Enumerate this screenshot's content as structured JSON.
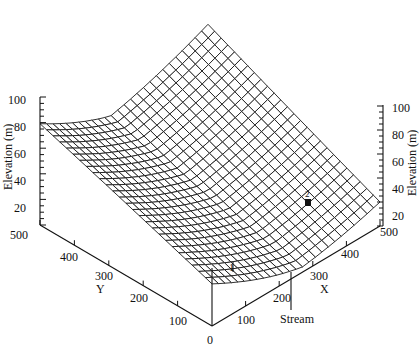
{
  "chart_data": {
    "type": "surface3d",
    "title": "",
    "zlabel": "Elevation (m)",
    "xlabel": "X",
    "ylabel": "Y",
    "x_ticks": [
      0,
      100,
      200,
      300,
      400,
      500
    ],
    "y_ticks": [
      0,
      100,
      200,
      300,
      400,
      500
    ],
    "z_ticks": [
      20,
      40,
      60,
      80,
      100
    ],
    "xlim": [
      0,
      500
    ],
    "ylim": [
      0,
      500
    ],
    "zlim": [
      0,
      100
    ],
    "grid": "wireframe mesh, approx 25 x 25 cells",
    "surface_description": "Valley surface: elevation ~100 m along high corner (Y=500, X=0) and far edge, descending to a stream channel near X~250-300 at Y=0; low point ~0-5 m near origin side",
    "annotations": [
      {
        "label": "1",
        "description": "marker near valley bottom close to Y~50, X~150"
      },
      {
        "label": "2",
        "description": "filled square marker on right slope near X~400, Y~200"
      },
      {
        "label": "Stream",
        "description": "pointer to stream outlet at X~260, Y=0"
      }
    ]
  },
  "labels": {
    "zaxis_left": "Elevation (m)",
    "zaxis_right": "Elevation (m)",
    "x_axis": "X",
    "y_axis": "Y",
    "stream": "Stream",
    "marker1": "1",
    "marker2": "2",
    "origin": "0",
    "z_left_ticks": [
      "100",
      "80",
      "60",
      "40",
      "20"
    ],
    "z_right_ticks": [
      "100",
      "80",
      "60",
      "40",
      "20"
    ],
    "y_ticks": [
      "500",
      "400",
      "300",
      "200",
      "100"
    ],
    "x_ticks": [
      "100",
      "200",
      "300",
      "400",
      "500"
    ]
  }
}
